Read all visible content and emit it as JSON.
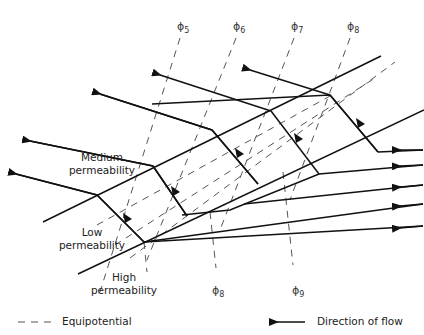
{
  "diagram": {
    "type": "refraction of groundwater flow across layers of differing permeability",
    "layers": [
      {
        "id": "medium",
        "label_line1": "Medium",
        "label_line2": "permeability"
      },
      {
        "id": "low",
        "label_line1": "Low",
        "label_line2": "permeability"
      },
      {
        "id": "high",
        "label_line1": "High",
        "label_line2": "permeability"
      }
    ],
    "equipotentials_top": [
      {
        "symbol": "ϕ",
        "sub": "5"
      },
      {
        "symbol": "ϕ",
        "sub": "6"
      },
      {
        "symbol": "ϕ",
        "sub": "7"
      },
      {
        "symbol": "ϕ",
        "sub": "8"
      }
    ],
    "equipotentials_bottom": [
      {
        "symbol": "ϕ",
        "sub": "8"
      },
      {
        "symbol": "ϕ",
        "sub": "9"
      }
    ],
    "legend": {
      "equipotential_label": "Equipotential",
      "flow_label": "Direction of flow"
    },
    "colors": {
      "line": "#111111",
      "dashed": "#555555",
      "background": "#ffffff"
    }
  }
}
